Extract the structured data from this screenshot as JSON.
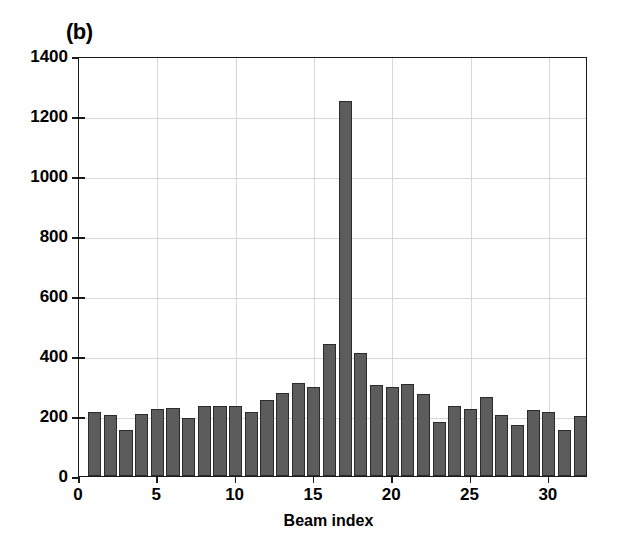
{
  "figure": {
    "panel_label": "(b)",
    "background_color": "#ffffff"
  },
  "chart_data": {
    "type": "bar",
    "title": "(b)",
    "xlabel": "Beam index",
    "ylabel": "",
    "xlim": [
      0,
      32.5
    ],
    "ylim": [
      0,
      1400
    ],
    "grid": true,
    "legend": null,
    "bar_color": "#5c5c5c",
    "bar_edge_color": "#2b2b2b",
    "x_ticks": [
      0,
      5,
      10,
      15,
      20,
      25,
      30
    ],
    "y_ticks": [
      0,
      200,
      400,
      600,
      800,
      1000,
      1200,
      1400
    ],
    "categories": [
      1,
      2,
      3,
      4,
      5,
      6,
      7,
      8,
      9,
      10,
      11,
      12,
      13,
      14,
      15,
      16,
      17,
      18,
      19,
      20,
      21,
      22,
      23,
      24,
      25,
      26,
      27,
      28,
      29,
      30,
      31,
      32
    ],
    "values": [
      212,
      205,
      155,
      208,
      225,
      228,
      192,
      233,
      235,
      233,
      215,
      252,
      277,
      310,
      296,
      440,
      1250,
      410,
      305,
      297,
      307,
      273,
      180,
      235,
      222,
      265,
      205,
      170,
      220,
      213,
      153,
      200
    ]
  }
}
